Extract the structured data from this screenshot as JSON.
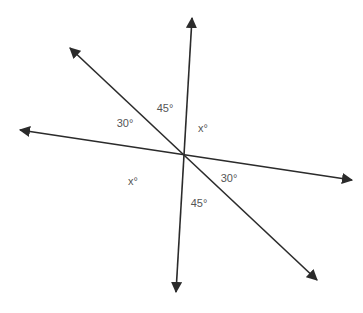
{
  "diagram": {
    "type": "intersecting-lines-angles",
    "intersection": {
      "x": 184,
      "y": 155
    },
    "lines": [
      {
        "name": "near-vertical-line",
        "from": {
          "x": 192,
          "y": 18
        },
        "to": {
          "x": 176,
          "y": 292
        }
      },
      {
        "name": "diagonal-line",
        "from": {
          "x": 70,
          "y": 48
        },
        "to": {
          "x": 317,
          "y": 280
        }
      },
      {
        "name": "near-horizontal-line",
        "from": {
          "x": 20,
          "y": 130
        },
        "to": {
          "x": 352,
          "y": 180
        }
      }
    ],
    "line_color": "#2b2b2b",
    "label_color": "#555555"
  },
  "labels": {
    "upper_left_30": "30°",
    "upper_45": "45°",
    "upper_right_x": "x°",
    "lower_left_x": "x°",
    "lower_right_30": "30°",
    "lower_45": "45°"
  }
}
